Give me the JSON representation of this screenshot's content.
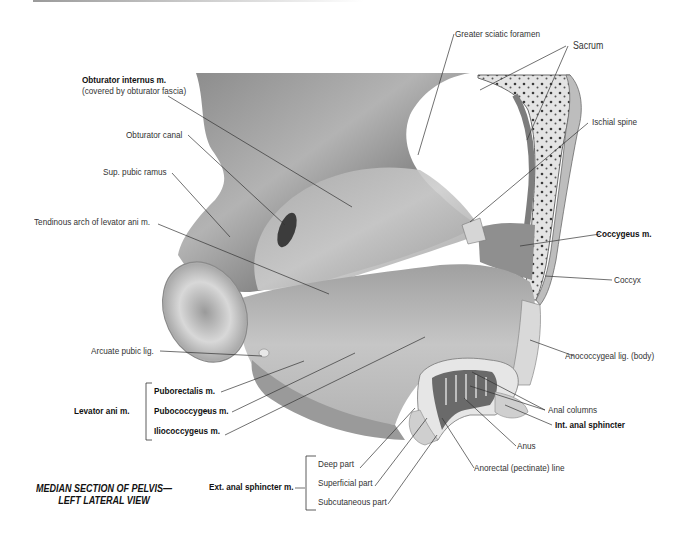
{
  "figure": {
    "title_line1": "MEDIAN SECTION OF PELVIS—",
    "title_line2": "LEFT LATERAL VIEW"
  },
  "labels": {
    "greater_sciatic_foramen": "Greater sciatic foramen",
    "sacrum": "Sacrum",
    "obturator_internus": "Obturator internus m.",
    "obturator_internus_note": "(covered by obturator fascia)",
    "ischial_spine": "Ischial spine",
    "obturator_canal": "Obturator canal",
    "sup_pubic_ramus": "Sup. pubic ramus",
    "tendinous_arch": "Tendinous arch of levator ani m.",
    "coccygeus": "Coccygeus m.",
    "coccyx": "Coccyx",
    "arcuate_pubic_lig": "Arcuate pubic lig.",
    "anococcygeal_lig": "Anococcygeal lig. (body)",
    "levator_ani": "Levator ani m.",
    "puborectalis": "Puborectalis m.",
    "pubococcygeus": "Pubococcygeus m.",
    "iliococcygeus": "Iliococcygeus m.",
    "anal_columns": "Anal columns",
    "int_anal_sphincter": "Int. anal sphincter",
    "anus": "Anus",
    "anorectal_line": "Anorectal (pectinate) line",
    "ext_anal_sphincter": "Ext. anal sphincter m.",
    "deep_part": "Deep part",
    "superficial_part": "Superficial part",
    "subcutaneous_part": "Subcutaneous part"
  },
  "colors": {
    "background": "#ffffff",
    "bone_dark": "#5e5e5e",
    "bone_mid": "#9a9a9a",
    "muscle_light": "#c8c8c8",
    "leader_line": "#333333"
  }
}
